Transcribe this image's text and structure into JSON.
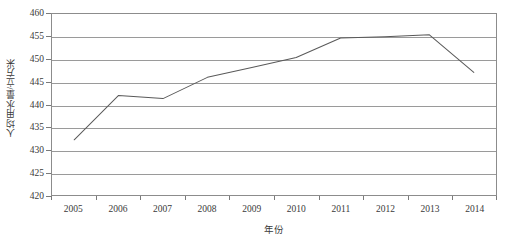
{
  "chart_data": {
    "type": "line",
    "title": "",
    "xlabel": "年份",
    "ylabel": "人均用水量/立方米",
    "categories": [
      "2005",
      "2006",
      "2007",
      "2008",
      "2009",
      "2010",
      "2011",
      "2012",
      "2013",
      "2014"
    ],
    "values": [
      432.2,
      442.0,
      441.3,
      446.0,
      448.2,
      450.4,
      454.7,
      455.0,
      455.4,
      447.1
    ],
    "series": [
      {
        "name": "人均用水量",
        "values": [
          432.2,
          442.0,
          441.3,
          446.0,
          448.2,
          450.4,
          454.7,
          455.0,
          455.4,
          447.1
        ]
      }
    ],
    "ylim": [
      420,
      460
    ],
    "y_ticks": [
      "460",
      "455",
      "450",
      "445",
      "440",
      "435",
      "430",
      "425",
      "420"
    ],
    "y_tick_values": [
      460,
      455,
      450,
      445,
      440,
      435,
      430,
      425,
      420
    ],
    "grid": true,
    "legend": "none",
    "line_color": "#595959",
    "grid_color": "#9a9a9a",
    "axis_color": "#8c8c8c",
    "background": "#ffffff"
  }
}
